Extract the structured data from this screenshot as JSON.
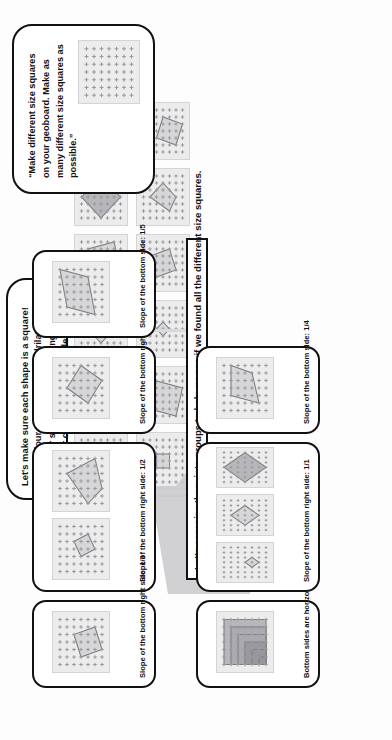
{
  "slide": {
    "title": "Geoboard Squares Sorting Activity",
    "background_color": "#fdfdfd",
    "ink_color": "#111111",
    "board_fill": "#ececed",
    "shape_fill": "#c8c8cb"
  },
  "task_callout": {
    "name": "task-prompt-callout",
    "text": "“Make different size squares on your geoboard. Make as many different size squares as possible.”",
    "board": {
      "rows": 7,
      "cols": 7,
      "shapes": []
    }
  },
  "check_callout": {
    "name": "square-check-callout",
    "heading": "Let's make sure each shape is a square!",
    "bullets": [
      "It's a four-sided shape (quadrilateral).",
      "All four sides are the same length.",
      "All four corners are right angles."
    ]
  },
  "banner": {
    "name": "organize-banner",
    "text": "Let's organize them into groups to help us see if we found all the different size squares."
  },
  "pool": {
    "label": "unsorted-squares-pool",
    "boards": [
      {
        "id": "pool-1",
        "rows": 7,
        "cols": 7,
        "shape": [
          [
            1,
            1
          ],
          [
            4,
            2
          ],
          [
            5,
            5
          ],
          [
            2,
            4
          ]
        ],
        "tone": "normal"
      },
      {
        "id": "pool-2",
        "rows": 7,
        "cols": 7,
        "shape": [
          [
            1,
            5
          ],
          [
            2,
            1
          ],
          [
            6,
            2
          ],
          [
            5,
            6
          ]
        ],
        "tone": "normal"
      },
      {
        "id": "pool-3",
        "rows": 7,
        "cols": 7,
        "shape": [
          [
            3,
            1
          ],
          [
            5,
            3
          ],
          [
            3,
            5
          ],
          [
            1,
            3
          ]
        ],
        "tone": "normal"
      },
      {
        "id": "pool-4",
        "rows": 7,
        "cols": 7,
        "shape": [
          [
            1,
            2
          ],
          [
            5,
            1
          ],
          [
            6,
            5
          ],
          [
            2,
            6
          ]
        ],
        "tone": "normal"
      },
      {
        "id": "pool-5",
        "rows": 7,
        "cols": 7,
        "shape": [
          [
            3,
            0
          ],
          [
            6,
            3
          ],
          [
            3,
            6
          ],
          [
            0,
            3
          ]
        ],
        "tone": "dark"
      },
      {
        "id": "pool-6",
        "rows": 7,
        "cols": 7,
        "shape": "nested",
        "tone": "darker"
      },
      {
        "id": "pool-7",
        "rows": 7,
        "cols": 7,
        "shape": [
          [
            2,
            2
          ],
          [
            4,
            2
          ],
          [
            4,
            4
          ],
          [
            2,
            4
          ]
        ],
        "tone": "normal"
      },
      {
        "id": "pool-8",
        "rows": 7,
        "cols": 7,
        "shape": [
          [
            1,
            1
          ],
          [
            5,
            2
          ],
          [
            4,
            6
          ],
          [
            0,
            5
          ]
        ],
        "tone": "normal"
      },
      {
        "id": "pool-9",
        "rows": 7,
        "cols": 7,
        "shape": [
          [
            2,
            3
          ],
          [
            3,
            2
          ],
          [
            4,
            3
          ],
          [
            3,
            4
          ]
        ],
        "tone": "normal"
      },
      {
        "id": "pool-10",
        "rows": 7,
        "cols": 7,
        "shape": [
          [
            1,
            2
          ],
          [
            4,
            1
          ],
          [
            5,
            4
          ],
          [
            2,
            5
          ]
        ],
        "tone": "normal"
      },
      {
        "id": "pool-11",
        "rows": 7,
        "cols": 7,
        "shape": [
          [
            1,
            4
          ],
          [
            3,
            1
          ],
          [
            5,
            3
          ],
          [
            3,
            5
          ]
        ],
        "tone": "normal"
      },
      {
        "id": "pool-12",
        "rows": 7,
        "cols": 7,
        "shape": [
          [
            2,
            2
          ],
          [
            5,
            3
          ],
          [
            4,
            6
          ],
          [
            1,
            5
          ]
        ],
        "tone": "normal"
      }
    ]
  },
  "groups": [
    {
      "id": "group-horizontal",
      "label": "Bottom sides are horizontal",
      "boards": [
        {
          "id": "g0-b1",
          "rows": 7,
          "cols": 7,
          "shape": "nested",
          "tone": "darker"
        }
      ]
    },
    {
      "id": "group-slope-1-1",
      "label": "Slope of the bottom right side: 1/1",
      "boards": [
        {
          "id": "g1-b1",
          "rows": 7,
          "cols": 7,
          "shape": [
            [
              2,
              4
            ],
            [
              3,
              3
            ],
            [
              4,
              4
            ],
            [
              3,
              5
            ]
          ],
          "tone": "normal"
        },
        {
          "id": "g1-b2",
          "rows": 7,
          "cols": 7,
          "shape": [
            [
              1,
              3
            ],
            [
              3,
              1
            ],
            [
              5,
              3
            ],
            [
              3,
              5
            ]
          ],
          "tone": "normal"
        },
        {
          "id": "g1-b3",
          "rows": 7,
          "cols": 7,
          "shape": [
            [
              0,
              3
            ],
            [
              3,
              0
            ],
            [
              6,
              3
            ],
            [
              3,
              6
            ]
          ],
          "tone": "dark"
        }
      ]
    },
    {
      "id": "group-slope-1-2",
      "label": "Slope of the bottom right side: 1/2",
      "boards": [
        {
          "id": "g2-b1",
          "rows": 7,
          "cols": 7,
          "shape": [
            [
              2,
              3
            ],
            [
              4,
              2
            ],
            [
              5,
              4
            ],
            [
              3,
              5
            ]
          ],
          "tone": "normal"
        },
        {
          "id": "g2-b2",
          "rows": 7,
          "cols": 7,
          "shape": [
            [
              0,
              4
            ],
            [
              4,
              1
            ],
            [
              6,
              5
            ],
            [
              2,
              6
            ]
          ],
          "tone": "normal"
        }
      ]
    },
    {
      "id": "group-slope-1-3",
      "label": "Slope of the bottom right side: 1/3",
      "boards": [
        {
          "id": "g3-b1",
          "rows": 7,
          "cols": 7,
          "shape": [
            [
              1,
              3
            ],
            [
              4,
              2
            ],
            [
              5,
              5
            ],
            [
              2,
              6
            ]
          ],
          "tone": "normal"
        }
      ]
    },
    {
      "id": "group-slope-2-3",
      "label": "Slope of the bottom right side: 2/3",
      "boards": [
        {
          "id": "g4-b1",
          "rows": 7,
          "cols": 7,
          "shape": [
            [
              1,
              4
            ],
            [
              3,
              1
            ],
            [
              6,
              3
            ],
            [
              4,
              6
            ]
          ],
          "tone": "normal"
        }
      ]
    },
    {
      "id": "group-slope-1-5",
      "label": "Slope of the bottom side: 1/5",
      "boards": [
        {
          "id": "g5-b1",
          "rows": 7,
          "cols": 7,
          "shape": [
            [
              0,
              5
            ],
            [
              5,
              4
            ],
            [
              6,
              0
            ],
            [
              1,
              1
            ]
          ],
          "tone": "normal"
        }
      ]
    },
    {
      "id": "group-slope-1-4",
      "label": "Slope of the bottom side: 1/4",
      "boards": [
        {
          "id": "g6-b1",
          "rows": 7,
          "cols": 7,
          "shape": [
            [
              1,
              5
            ],
            [
              5,
              4
            ],
            [
              6,
              1
            ],
            [
              2,
              1
            ]
          ],
          "tone": "normal"
        }
      ]
    }
  ]
}
